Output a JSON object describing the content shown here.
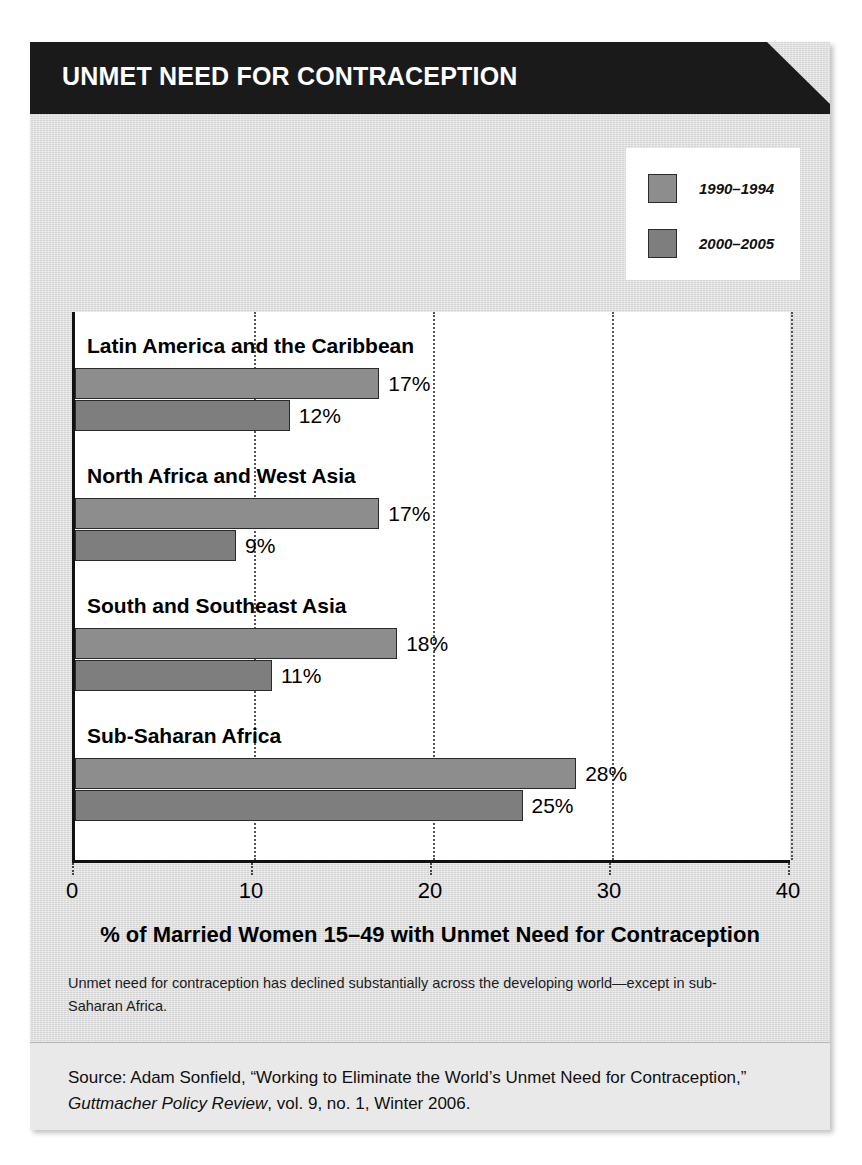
{
  "header": {
    "title": "UNMET NEED FOR CONTRACEPTION"
  },
  "legend": {
    "position": "top-right",
    "items": [
      {
        "label": "1990–1994",
        "color": "#8d8d8d"
      },
      {
        "label": "2000–2005",
        "color": "#7e7e7e"
      }
    ]
  },
  "caption": "Unmet need for contraception has declined substantially across the developing world—except in sub-Saharan Africa.",
  "source": {
    "prefix": "Source: Adam Sonfield, “Working to Eliminate the World’s Unmet Need for Contraception,” ",
    "publication": "Guttmacher Policy Review",
    "suffix": ", vol. 9, no. 1, Winter 2006."
  },
  "chart_data": {
    "type": "bar",
    "orientation": "horizontal",
    "title": "UNMET NEED FOR CONTRACEPTION",
    "xlabel": "% of Married Women 15–49 with Unmet Need for Contraception",
    "ylabel": "",
    "xlim": [
      0,
      40
    ],
    "xticks": [
      0,
      10,
      20,
      30,
      40
    ],
    "xtick_labels": [
      "0",
      "10",
      "20",
      "30",
      "40"
    ],
    "grid": "vertical-dotted",
    "legend_position": "top-right",
    "categories": [
      "Latin America and the Caribbean",
      "North Africa and West Asia",
      "South and Southeast Asia",
      "Sub-Saharan Africa"
    ],
    "series": [
      {
        "name": "1990–1994",
        "color": "#8d8d8d",
        "values": [
          17,
          17,
          18,
          28
        ],
        "value_labels": [
          "17%",
          "17%",
          "18%",
          "28%"
        ]
      },
      {
        "name": "2000–2005",
        "color": "#7e7e7e",
        "values": [
          12,
          9,
          11,
          25
        ],
        "value_labels": [
          "12%",
          "9%",
          "11%",
          "25%"
        ]
      }
    ]
  }
}
